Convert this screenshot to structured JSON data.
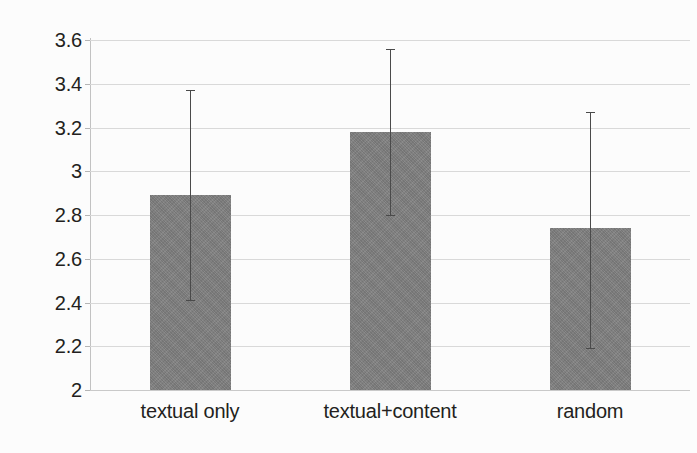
{
  "chart_data": {
    "type": "bar",
    "title": "",
    "subtitle": "",
    "xlabel": "",
    "ylabel": "",
    "categories": [
      "textual only",
      "textual+content",
      "random"
    ],
    "values": [
      2.89,
      3.18,
      2.74
    ],
    "series": [
      {
        "name": "mean rating",
        "values": [
          2.89,
          3.18,
          2.74
        ]
      }
    ],
    "error_bars": {
      "type": "asymmetric-range",
      "lower": [
        2.41,
        2.8,
        2.19
      ],
      "upper": [
        3.37,
        3.56,
        3.27
      ]
    },
    "ylim": [
      2,
      3.6
    ],
    "xlim": [
      0,
      3
    ],
    "yticks": [
      2,
      2.2,
      2.4,
      2.6,
      2.8,
      3,
      3.2,
      3.4,
      3.6
    ],
    "ytick_labels": [
      "2",
      "2.2",
      "2.4",
      "2.6",
      "2.8",
      "3",
      "3.2",
      "3.4",
      "3.6"
    ],
    "grid": true,
    "grid_axis": "y",
    "legend": false,
    "legend_position": "none",
    "bar_color": "#808080",
    "errorbar_color": "#4a4a4a",
    "gridline_color": "#d9d9d9",
    "axis_color": "#c2c2c2",
    "text_color": "#231f20",
    "background_color": "#ffffff"
  },
  "axis": {
    "y_ticks": [
      {
        "label": "3.6",
        "value": 3.6
      },
      {
        "label": "3.4",
        "value": 3.4
      },
      {
        "label": "3.2",
        "value": 3.2
      },
      {
        "label": "3",
        "value": 3
      },
      {
        "label": "2.8",
        "value": 2.8
      },
      {
        "label": "2.6",
        "value": 2.6
      },
      {
        "label": "2.4",
        "value": 2.4
      },
      {
        "label": "2.2",
        "value": 2.2
      },
      {
        "label": "2",
        "value": 2
      }
    ]
  },
  "bars": [
    {
      "category": "textual only",
      "value": 2.89,
      "lower": 2.41,
      "upper": 3.37
    },
    {
      "category": "textual+content",
      "value": 3.18,
      "lower": 2.8,
      "upper": 3.56
    },
    {
      "category": "random",
      "value": 2.74,
      "lower": 2.19,
      "upper": 3.27
    }
  ]
}
